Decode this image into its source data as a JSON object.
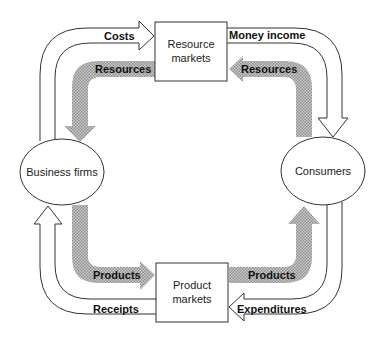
{
  "diagram": {
    "nodes": {
      "resource_markets": {
        "line1": "Resource",
        "line2": "markets"
      },
      "product_markets": {
        "line1": "Product",
        "line2": "markets"
      },
      "business_firms": {
        "label": "Business firms"
      },
      "consumers": {
        "label": "Consumers"
      }
    },
    "money_flows": {
      "costs": "Costs",
      "money_income": "Money income",
      "expenditures": "Expenditures",
      "receipts": "Receipts"
    },
    "real_flows": {
      "resources_left": "Resources",
      "resources_right": "Resources",
      "products_left": "Products",
      "products_right": "Products"
    },
    "colors": {
      "line": "#333333",
      "real_flow_fill": "#b8b8b8",
      "background": "#ffffff"
    }
  }
}
